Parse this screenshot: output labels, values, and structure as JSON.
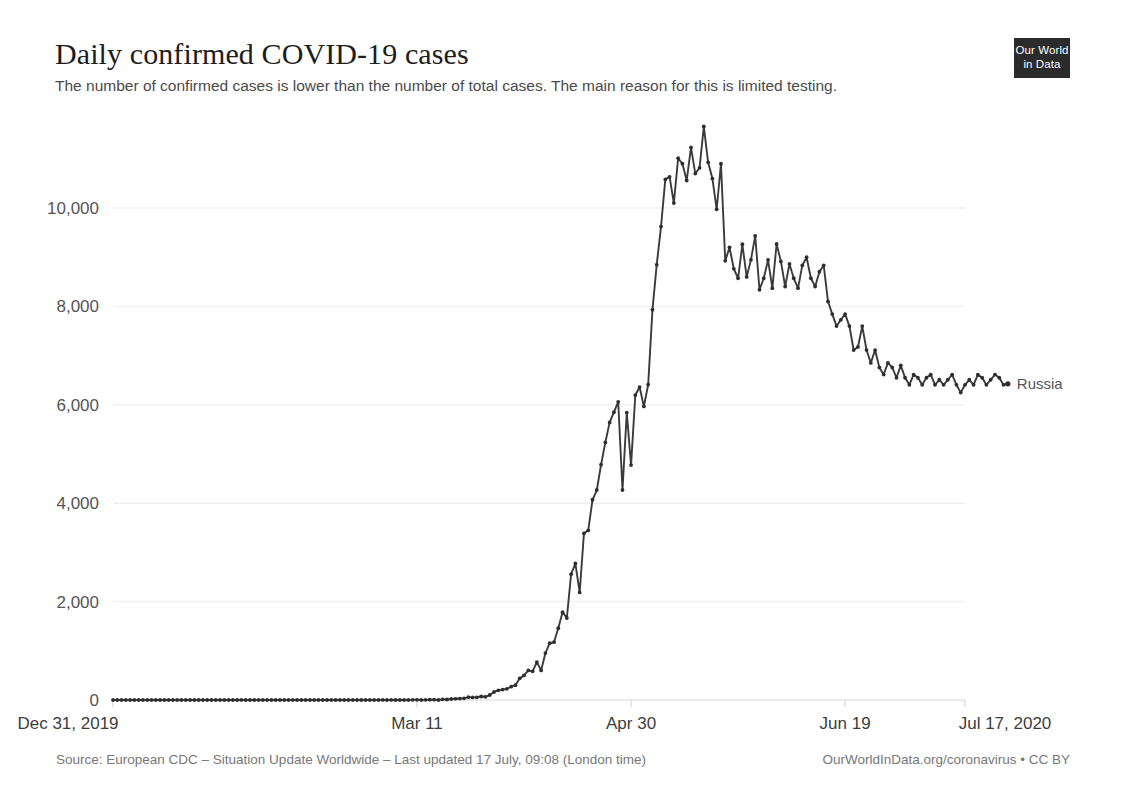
{
  "header": {
    "title": "Daily confirmed COVID-19 cases",
    "subtitle": "The number of confirmed cases is lower than the number of total cases. The main reason for this is limited testing.",
    "logo_line1": "Our World",
    "logo_line2": "in Data"
  },
  "footer": {
    "source": "Source: European CDC – Situation Update Worldwide – Last updated 17 July, 09:08 (London time)",
    "attribution": "OurWorldInData.org/coronavirus • CC BY"
  },
  "colors": {
    "line": "#3b3b3b",
    "marker": "#2e2e2e",
    "grid": "#f0f0f0",
    "axis_text": "#555555",
    "background": "#ffffff",
    "logo_background": "#2b2b2b"
  },
  "chart_data": {
    "type": "line",
    "title": "Daily confirmed COVID-19 cases",
    "subtitle": "The number of confirmed cases is lower than the number of total cases. The main reason for this is limited testing.",
    "xlabel": "",
    "ylabel": "",
    "grid": true,
    "legend_position": "line-end-label",
    "xlim": [
      "2019-12-31",
      "2020-07-17"
    ],
    "ylim": [
      0,
      12000
    ],
    "ytick_labels": [
      "0",
      "2,000",
      "4,000",
      "6,000",
      "8,000",
      "10,000"
    ],
    "ytick_values": [
      0,
      2000,
      4000,
      6000,
      8000,
      10000
    ],
    "xtick_labels": [
      "Dec 31, 2019",
      "Mar 11",
      "Apr 30",
      "Jun 19",
      "Jul 17, 2020"
    ],
    "xtick_days": [
      0,
      71,
      121,
      171,
      199
    ],
    "series": [
      {
        "name": "Russia",
        "label": "Russia",
        "color": "#3b3b3b",
        "start_date": "2019-12-31",
        "values": [
          0,
          0,
          0,
          0,
          0,
          0,
          0,
          0,
          0,
          0,
          0,
          0,
          0,
          0,
          0,
          0,
          0,
          0,
          0,
          0,
          0,
          0,
          0,
          0,
          0,
          0,
          0,
          0,
          0,
          0,
          2,
          0,
          0,
          0,
          0,
          0,
          0,
          0,
          0,
          0,
          0,
          0,
          0,
          0,
          0,
          0,
          0,
          0,
          0,
          0,
          0,
          0,
          0,
          0,
          0,
          0,
          0,
          0,
          0,
          0,
          0,
          0,
          0,
          1,
          0,
          1,
          0,
          0,
          0,
          0,
          3,
          4,
          0,
          3,
          6,
          7,
          0,
          13,
          10,
          20,
          24,
          29,
          34,
          57,
          53,
          55,
          71,
          65,
          102,
          163,
          196,
          212,
          228,
          270,
          302,
          440,
          500,
          601,
          582,
          771,
          601,
          954,
          1154,
          1175,
          1459,
          1786,
          1667,
          2558,
          2774,
          2186,
          3388,
          3448,
          4070,
          4268,
          4785,
          5236,
          5642,
          5849,
          6060,
          4268,
          5841,
          4774,
          6198,
          6361,
          5966,
          6411,
          7933,
          8849,
          9623,
          10581,
          10633,
          10102,
          11012,
          10899,
          10559,
          11231,
          10699,
          10817,
          11656,
          10928,
          10598,
          9974,
          10899,
          8926,
          9200,
          8764,
          8572,
          9263,
          8599,
          8946,
          9434,
          8338,
          8572,
          8946,
          8371,
          9268,
          8915,
          8404,
          8863,
          8572,
          8371,
          8835,
          9000,
          8572,
          8404,
          8706,
          8835,
          8100,
          7843,
          7600,
          7728,
          7843,
          7600,
          7113,
          7176,
          7600,
          7113,
          6852,
          7113,
          6760,
          6615,
          6852,
          6760,
          6550,
          6802,
          6550,
          6406,
          6615,
          6550,
          6406,
          6550,
          6615,
          6406,
          6509,
          6406,
          6509,
          6615,
          6406,
          6248,
          6406,
          6509,
          6406,
          6615,
          6550,
          6406,
          6509,
          6615,
          6550,
          6406,
          6427
        ]
      }
    ]
  }
}
